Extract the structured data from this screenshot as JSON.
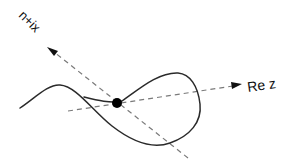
{
  "diagram": {
    "type": "complex-plane-curve",
    "labels": {
      "vertical_axis": "n+ix",
      "horizontal_axis": "Re z"
    },
    "elements": {
      "point": {
        "x": 117,
        "y": 103,
        "radius": 5,
        "color": "#000000"
      },
      "axis_re_z": {
        "from": [
          68,
          111
        ],
        "to": [
          240,
          85
        ]
      },
      "axis_n_ix": {
        "from": [
          188,
          158
        ],
        "to": [
          48,
          48
        ]
      }
    },
    "colors": {
      "curve": "#2a2a2a",
      "axis": "#7a7a7a",
      "point": "#000000"
    }
  }
}
